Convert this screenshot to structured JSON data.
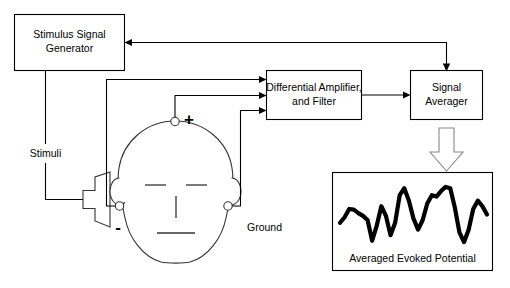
{
  "diagram": {
    "background_color": "#ffffff",
    "line_color": "#000000",
    "boxes": [
      {
        "id": "stimulus-signal-generator",
        "label_line1": "Stimulus Signal",
        "label_line2": "Generator"
      },
      {
        "id": "differential-amplifier",
        "label_line1": "Differential Amplifier,",
        "label_line2": "and Filter"
      },
      {
        "id": "signal-averager",
        "label_line1": "Signal",
        "label_line2": "Averager"
      }
    ],
    "labels": {
      "stimuli": "Stimuli",
      "ground": "Ground",
      "plus": "+",
      "minus": "-",
      "averaged_evoked_potential": "Averaged Evoked Potential"
    },
    "icons": {
      "speaker": "speaker-icon",
      "head": "head-icon",
      "electrode_top": "electrode-icon",
      "electrode_left": "electrode-icon",
      "electrode_right": "electrode-icon",
      "block_arrow": "down-block-arrow-icon"
    },
    "connections": [
      {
        "from": "signal-averager",
        "to": "stimulus-signal-generator",
        "type": "feedback-trigger"
      },
      {
        "from": "stimulus-signal-generator",
        "to": "speaker-icon",
        "type": "stimuli-output"
      },
      {
        "from": "electrode-top-plus",
        "to": "differential-amplifier",
        "type": "electrode-input"
      },
      {
        "from": "electrode-left-minus",
        "to": "differential-amplifier",
        "type": "electrode-input"
      },
      {
        "from": "electrode-right-ground",
        "to": "differential-amplifier",
        "type": "electrode-input"
      },
      {
        "from": "differential-amplifier",
        "to": "signal-averager",
        "type": "signal"
      },
      {
        "from": "signal-averager",
        "to": "averaged-evoked-potential-plot",
        "type": "output"
      }
    ]
  },
  "chart_data": {
    "type": "line",
    "title": "Averaged Evoked Potential",
    "xlabel": "",
    "ylabel": "",
    "grid": false,
    "legend": "none",
    "x": [
      0,
      1,
      2,
      3,
      4,
      5,
      6,
      7,
      8,
      9,
      10,
      11,
      12,
      13,
      14,
      15,
      16,
      17,
      18,
      19,
      20,
      21,
      22,
      23,
      24,
      25,
      26,
      27,
      28,
      29,
      30,
      31,
      32
    ],
    "values": [
      38,
      46,
      58,
      57,
      52,
      48,
      42,
      12,
      34,
      62,
      48,
      20,
      38,
      78,
      88,
      70,
      44,
      28,
      42,
      66,
      78,
      76,
      84,
      90,
      88,
      60,
      24,
      10,
      28,
      58,
      70,
      62,
      50
    ],
    "ylim": [
      0,
      100
    ],
    "xlim": [
      0,
      32
    ]
  }
}
